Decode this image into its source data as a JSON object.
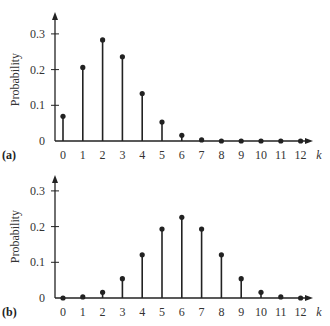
{
  "chart_data": [
    {
      "type": "bar",
      "subtype": "stem",
      "panel_label": "(a)",
      "title": "",
      "xlabel": "k",
      "ylabel": "Probability",
      "categories": [
        "0",
        "1",
        "2",
        "3",
        "4",
        "5",
        "6",
        "7",
        "8",
        "9",
        "10",
        "11",
        "12"
      ],
      "values": [
        0.069,
        0.206,
        0.283,
        0.236,
        0.133,
        0.053,
        0.016,
        0.003,
        0.001,
        0.0,
        0.0,
        0.0,
        0.0
      ],
      "yticks": [
        "0",
        "0.1",
        "0.2",
        "0.3"
      ],
      "ylim": [
        0,
        0.35
      ],
      "grid": false,
      "legend": null
    },
    {
      "type": "bar",
      "subtype": "stem",
      "panel_label": "(b)",
      "title": "",
      "xlabel": "k",
      "ylabel": "Probability",
      "categories": [
        "0",
        "1",
        "2",
        "3",
        "4",
        "5",
        "6",
        "7",
        "8",
        "9",
        "10",
        "11",
        "12"
      ],
      "values": [
        0.0,
        0.003,
        0.016,
        0.054,
        0.121,
        0.193,
        0.226,
        0.193,
        0.121,
        0.054,
        0.016,
        0.003,
        0.0
      ],
      "yticks": [
        "0",
        "0.1",
        "0.2",
        "0.3"
      ],
      "ylim": [
        0,
        0.35
      ],
      "grid": false,
      "legend": null
    }
  ],
  "colors": {
    "stem": "#222222",
    "axis": "#222222"
  }
}
